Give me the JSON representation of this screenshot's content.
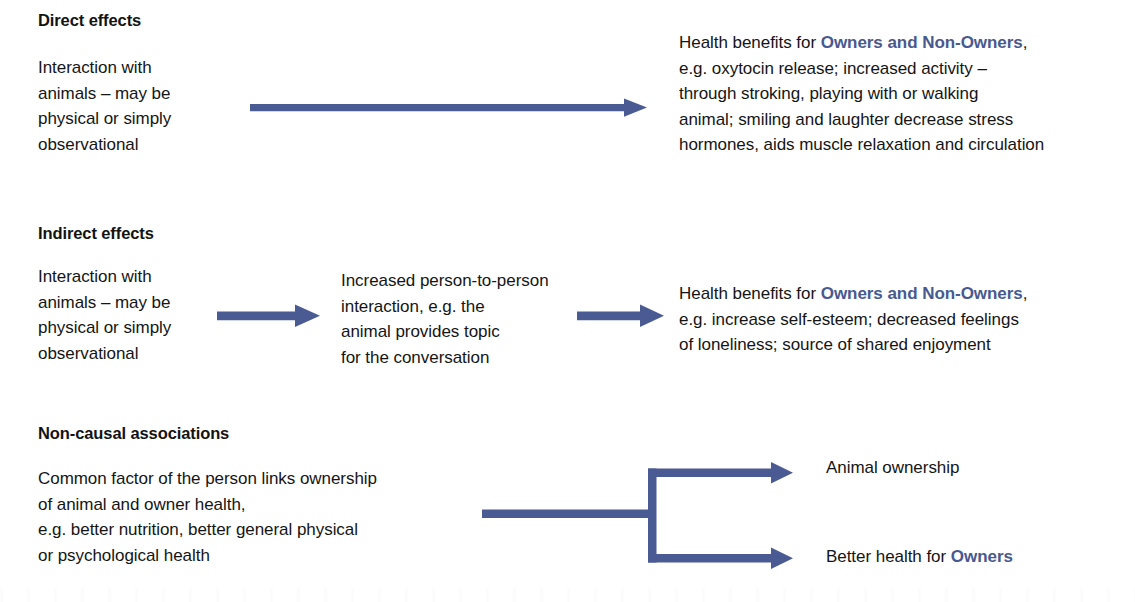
{
  "meta": {
    "arrow_color": "#4a5b93",
    "accent_text_color": "#48598f",
    "text_color": "#151515",
    "background": "#ffffff"
  },
  "sections": [
    {
      "id": "direct-effects",
      "heading": "Direct effects",
      "cause": {
        "lines": [
          "Interaction with",
          "animals – may be",
          "physical or simply",
          "observational"
        ]
      },
      "outcome": {
        "lead": "Health benefits for ",
        "accent": "Owners and Non-Owners",
        "rest_line1": ",",
        "lines": [
          "e.g. oxytocin release; increased activity –",
          "through stroking, playing with or walking",
          "animal; smiling and laughter decrease stress",
          "hormones, aids muscle relaxation and circulation"
        ]
      },
      "arrows": [
        {
          "name": "direct-effects-arrow",
          "type": "straight"
        }
      ]
    },
    {
      "id": "indirect-effects",
      "heading": "Indirect effects",
      "cause": {
        "lines": [
          "Interaction with",
          "animals – may be",
          "physical or simply",
          "observational"
        ]
      },
      "mediator": {
        "lines": [
          "Increased person-to-person",
          "interaction, e.g. the",
          "animal provides topic",
          "for the conversation"
        ]
      },
      "outcome": {
        "lead": "Health benefits for ",
        "accent": "Owners and Non-Owners",
        "rest_line1": ",",
        "lines": [
          "e.g. increase self-esteem; decreased feelings",
          "of loneliness; source of shared enjoyment"
        ]
      },
      "arrows": [
        {
          "name": "indirect-effects-arrow-1",
          "type": "straight"
        },
        {
          "name": "indirect-effects-arrow-2",
          "type": "straight"
        }
      ]
    },
    {
      "id": "non-causal-associations",
      "heading": "Non-causal associations",
      "cause": {
        "lines": [
          "Common factor of the person links ownership",
          "of animal and owner health,",
          "e.g. better nutrition, better general physical",
          "or psychological health"
        ]
      },
      "outcomes": [
        {
          "id": "animal-ownership",
          "lead": "Animal ownership",
          "accent": "",
          "trailing": ""
        },
        {
          "id": "better-health-owners",
          "lead": "Better health for ",
          "accent": "Owners",
          "trailing": ""
        }
      ],
      "arrows": [
        {
          "name": "non-causal-branching-arrow",
          "type": "branching"
        }
      ]
    }
  ]
}
